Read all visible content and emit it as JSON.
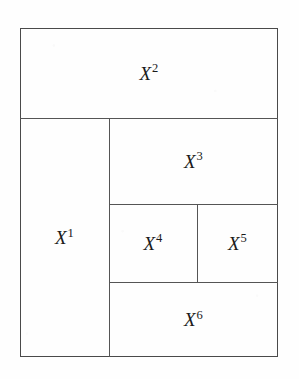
{
  "figure": {
    "kind": "rectangle-partition-diagram",
    "background_color": "#fefefe",
    "line_color": "#555555",
    "frame_color": "#4a4a4a",
    "label_color": "#1a1a1a"
  },
  "frame": {
    "x": 20,
    "y": 28,
    "width": 258,
    "height": 329
  },
  "regions": [
    {
      "id": "region-x1",
      "base": "X",
      "exponent": "1",
      "label": "X1",
      "x": 20,
      "y": 118,
      "width": 89,
      "height": 239
    },
    {
      "id": "region-x2",
      "base": "X",
      "exponent": "2",
      "label": "X2",
      "x": 20,
      "y": 28,
      "width": 258,
      "height": 90
    },
    {
      "id": "region-x3",
      "base": "X",
      "exponent": "3",
      "label": "X3",
      "x": 109,
      "y": 118,
      "width": 169,
      "height": 86
    },
    {
      "id": "region-x4",
      "base": "X",
      "exponent": "4",
      "label": "X4",
      "x": 109,
      "y": 204,
      "width": 88,
      "height": 78
    },
    {
      "id": "region-x5",
      "base": "X",
      "exponent": "5",
      "label": "X5",
      "x": 197,
      "y": 204,
      "width": 81,
      "height": 78
    },
    {
      "id": "region-x6",
      "base": "X",
      "exponent": "6",
      "label": "X6",
      "x": 109,
      "y": 282,
      "width": 169,
      "height": 75
    }
  ],
  "edges": [
    {
      "id": "edge-x2-bottom",
      "orientation": "horizontal",
      "x": 20,
      "y": 118,
      "length": 258
    },
    {
      "id": "edge-x3-bottom",
      "orientation": "horizontal",
      "x": 109,
      "y": 204,
      "length": 169
    },
    {
      "id": "edge-x45-bottom",
      "orientation": "horizontal",
      "x": 109,
      "y": 282,
      "length": 169
    },
    {
      "id": "edge-x1-right",
      "orientation": "vertical",
      "x": 109,
      "y": 118,
      "length": 239
    },
    {
      "id": "edge-x4-x5-divider",
      "orientation": "vertical",
      "x": 197,
      "y": 204,
      "length": 78
    }
  ]
}
